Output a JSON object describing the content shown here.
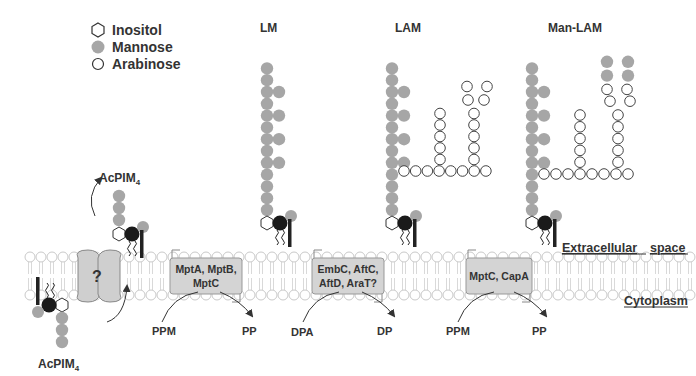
{
  "legend": {
    "items": [
      {
        "icon": "hexagon-outline",
        "label": "Inositol"
      },
      {
        "icon": "filled-gray-circle",
        "label": "Mannose"
      },
      {
        "icon": "open-circle",
        "label": "Arabinose"
      }
    ]
  },
  "titles": {
    "lm": "LM",
    "lam": "LAM",
    "manlam": "Man-LAM"
  },
  "acpim_top": {
    "base": "AcPIM",
    "sub": "4"
  },
  "acpim_bottom": {
    "base": "AcPIM",
    "sub": "4"
  },
  "flippase": {
    "label": "?"
  },
  "enzymes": [
    {
      "line1": "MptA, MptB,",
      "line2": "MptC"
    },
    {
      "line1": "EmbC, AftC,",
      "line2": "AftD, AraT?"
    },
    {
      "line1": "MptC, CapA",
      "line2": ""
    }
  ],
  "substrates": [
    {
      "donor": "PPM",
      "product": "PP"
    },
    {
      "donor": "DPA",
      "product": "DP"
    },
    {
      "donor": "PPM",
      "product": "PP"
    }
  ],
  "compartments": {
    "extracellular": {
      "word1": "Extracellular",
      "word2": "space"
    },
    "cytoplasm": "Cytoplasm"
  },
  "colors": {
    "mannose": "#a6a6a6",
    "inositol_stroke": "#333333",
    "lipid": "#c9c9c9",
    "enzyme_box": "#d4d4d4",
    "dark_node": "#1a1a1a"
  }
}
